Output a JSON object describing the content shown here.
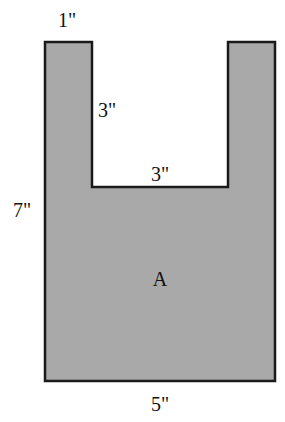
{
  "figure": {
    "shape_label": "A",
    "fill_color": "#a9a9a9",
    "stroke_color": "#1a1a1a",
    "dimensions": {
      "top_arm_width": "1\"",
      "notch_depth": "3\"",
      "notch_width": "3\"",
      "height": "7\"",
      "bottom_width": "5\""
    }
  }
}
